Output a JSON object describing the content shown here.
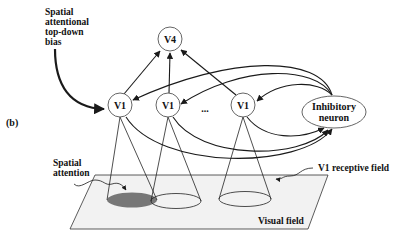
{
  "figure": {
    "panel_label": "(b)",
    "top_down_label": [
      "Spatial",
      "attentional",
      "top-down",
      "bias"
    ],
    "nodes": {
      "v4": "V4",
      "v1_left": "V1",
      "v1_mid": "V1",
      "v1_right": "V1",
      "ellipsis": "...",
      "inhibitory": [
        "Inhibitory",
        "neuron"
      ]
    },
    "spatial_attention_label": [
      "Spatial",
      "attention"
    ],
    "receptive_field_label": "V1 receptive field",
    "visual_field_label": "Visual field",
    "colors": {
      "stroke": "#1a1a1a",
      "plane_fill": "#f2f2f2",
      "attention_fill": "#777777"
    }
  }
}
